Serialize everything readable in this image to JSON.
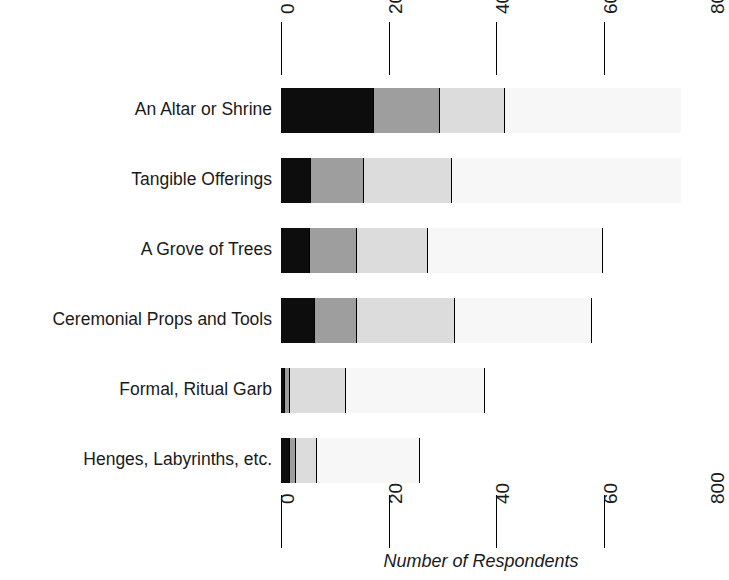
{
  "chart_data": {
    "type": "bar",
    "orientation": "horizontal",
    "stacked": true,
    "title": "",
    "xlabel": "Number of Respondents",
    "ylabel": "",
    "xlim": [
      0,
      800
    ],
    "xticks": [
      0,
      200,
      400,
      600,
      800
    ],
    "xticklabels": [
      "0",
      "200",
      "400",
      "600",
      "800"
    ],
    "grid": true,
    "grid_axis": "x",
    "legend": null,
    "categories": [
      "An Altar or Shrine",
      "Tangible Offerings",
      "A Grove of Trees",
      "Ceremonial Props and Tools",
      "Formal, Ritual Garb",
      "Henges, Labyrinths, etc."
    ],
    "series": [
      {
        "name": "Segment 1",
        "color": "#0d0d0d",
        "values": [
          173,
          56,
          54,
          63,
          7,
          17
        ]
      },
      {
        "name": "Segment 2",
        "color": "#9e9e9e",
        "values": [
          123,
          99,
          87,
          78,
          9,
          11
        ]
      },
      {
        "name": "Segment 3",
        "color": "#dcdcdc",
        "values": [
          121,
          163,
          132,
          182,
          104,
          39
        ]
      },
      {
        "name": "Segment 4",
        "color": "#f7f7f7",
        "values": [
          327,
          426,
          326,
          255,
          260,
          191
        ]
      },
      {
        "name": "Segment 5",
        "color": "#ffffff",
        "values": [
          0,
          0,
          145,
          166,
          364,
          486
        ]
      }
    ],
    "totals": [
      744,
      744,
      744,
      744,
      744,
      744
    ],
    "axis_color": "#000000",
    "background": "#ffffff"
  },
  "axis": {
    "top_ticks": [
      "0",
      "200",
      "400",
      "600",
      "800"
    ],
    "bottom_ticks": [
      "0",
      "200",
      "400",
      "600",
      "800"
    ],
    "title": "Number of Respondents"
  }
}
